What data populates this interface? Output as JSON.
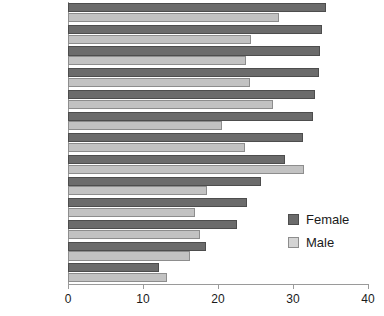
{
  "chart_data": {
    "type": "bar",
    "orientation": "horizontal",
    "title": "",
    "subtitle": "",
    "xlabel": "",
    "ylabel": "",
    "xlim": [
      0,
      40
    ],
    "xticks": [
      0,
      10,
      20,
      30,
      40
    ],
    "xtick_labels": [
      "0",
      "10",
      "20",
      "30",
      "40"
    ],
    "grid": false,
    "legend_position": "right-inside",
    "categories": [
      "Hungary",
      "Lithuania",
      "Estonia",
      "Slovakia",
      "Poland",
      "Slovenia",
      "Latvia",
      "Czech Rep.",
      "Turkey",
      "Romania",
      "Bulgaria",
      "Cyprus",
      "Malta"
    ],
    "series": [
      {
        "name": "Female",
        "color": "#6b6b6b",
        "values": [
          34.4,
          33.9,
          33.6,
          33.5,
          32.9,
          32.6,
          31.3,
          28.9,
          25.7,
          23.9,
          22.5,
          18.4,
          12.1
        ]
      },
      {
        "name": "Male",
        "color": "#c2c2c2",
        "values": [
          28.1,
          24.4,
          23.7,
          24.3,
          27.3,
          20.5,
          23.6,
          31.5,
          18.5,
          16.9,
          17.6,
          16.3,
          13.2
        ]
      }
    ]
  },
  "legend": {
    "entries": [
      {
        "label": "Female"
      },
      {
        "label": "Male"
      }
    ]
  }
}
